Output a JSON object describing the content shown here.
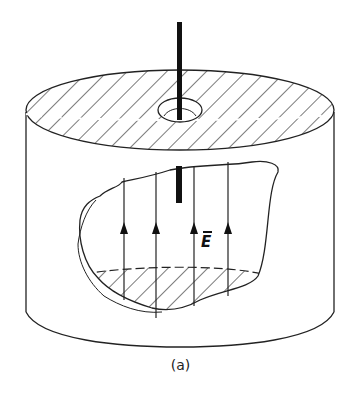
{
  "figure": {
    "caption": "(a)",
    "field_label": "E",
    "field_label_overbar": true,
    "field_arrow_count": 4,
    "colors": {
      "line": "#222222",
      "background": "#ffffff"
    }
  }
}
